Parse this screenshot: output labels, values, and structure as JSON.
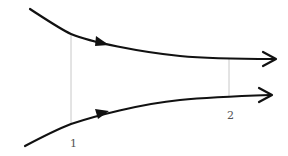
{
  "diagram": {
    "type": "converging-streamlines",
    "colors": {
      "stream": "#111111",
      "section_line": "#c0c0c0",
      "label": "#555555"
    },
    "streamlines": [
      {
        "name": "upper-streamline",
        "direction": "left-to-right"
      },
      {
        "name": "lower-streamline",
        "direction": "left-to-right"
      }
    ],
    "sections": [
      {
        "label": "1"
      },
      {
        "label": "2"
      }
    ]
  }
}
